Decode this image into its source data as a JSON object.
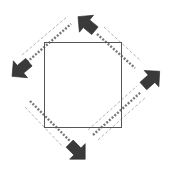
{
  "diagram": {
    "colors": {
      "background": "#ffffff",
      "square_stroke": "#555555",
      "arrow_fill": "#3a3a3a",
      "dotted_line": "#777777",
      "guide_line": "#b5b5b5"
    },
    "square": {
      "x": 44,
      "y": 42,
      "width": 77,
      "height": 85
    },
    "arrows": [
      {
        "name": "top",
        "direction": "up-left"
      },
      {
        "name": "left",
        "direction": "down-left"
      },
      {
        "name": "right",
        "direction": "up-right"
      },
      {
        "name": "bottom",
        "direction": "down-right"
      }
    ]
  }
}
